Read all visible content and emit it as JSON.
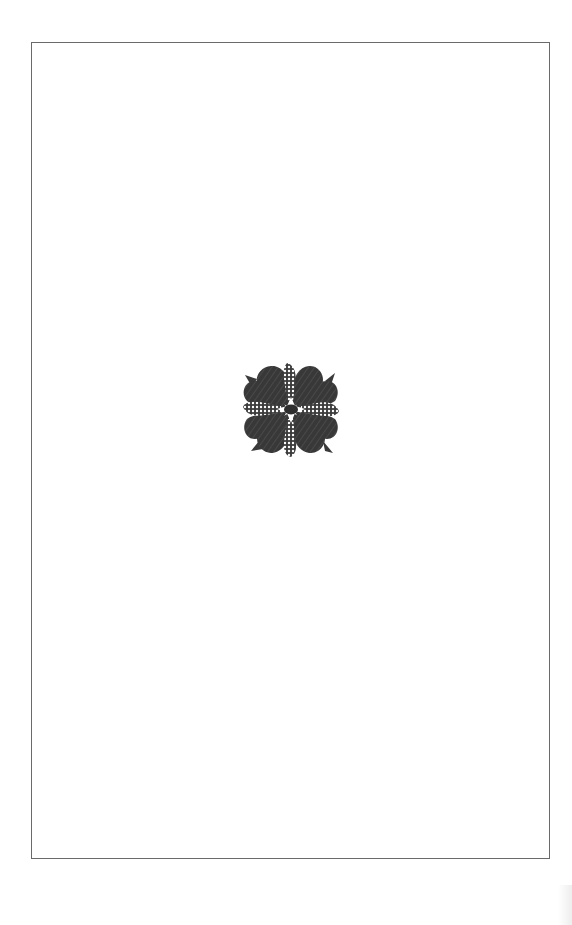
{
  "page": {
    "type": "book-page",
    "content": "decorative ornament only",
    "frame": {
      "visible": true,
      "color": "#6a6a6a"
    },
    "ornament": {
      "icon": "floral-ornament-icon",
      "description": "four-petal floral fleuron with dotted cross bands and leaf tips",
      "petal_color": "#3a3a3a",
      "band_color": "#ffffff"
    }
  }
}
